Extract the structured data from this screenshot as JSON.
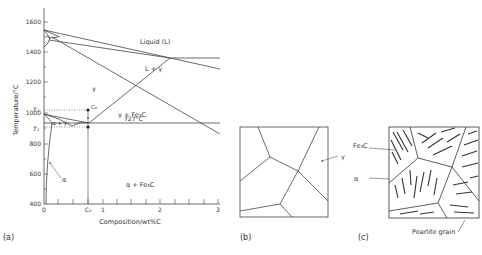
{
  "figure": {
    "panels": [
      {
        "id": "a",
        "label": "(a)",
        "type": "Fe-Fe3C phase diagram"
      },
      {
        "id": "b",
        "label": "(b)",
        "type": "austenite grains microstructure"
      },
      {
        "id": "c",
        "label": "(c)",
        "type": "pearlite microstructure"
      }
    ]
  },
  "phase_diagram": {
    "y_axis_label": "Temperature/°C",
    "x_axis_label": "Composition/wt%C",
    "y_ticks": [
      "1600",
      "1400",
      "1200",
      "1000",
      "800",
      "600",
      "400"
    ],
    "x_ticks": [
      "0",
      "1",
      "2",
      "3"
    ],
    "x_marker": "C₀",
    "y_markers": {
      "t1": "T₁",
      "t2": "T₂"
    },
    "regions": {
      "liquid": "Liquid (L)",
      "l_gamma": "L + γ",
      "gamma": "γ",
      "gamma_fe3c": "γ + Fe₃C",
      "alpha_gamma": "α + γ",
      "alpha": "α",
      "alpha_fe3c": "α + Fe₃C"
    },
    "eutectoid_label": "727°C",
    "point_label": "C₀"
  },
  "panel_b": {
    "gamma_label": "γ"
  },
  "panel_c": {
    "fe3c_label": "Fe₃C",
    "alpha_label": "α",
    "pearlite_label": "Pearlite grain"
  },
  "colors": {
    "line": "#444444",
    "text": "#333333"
  }
}
